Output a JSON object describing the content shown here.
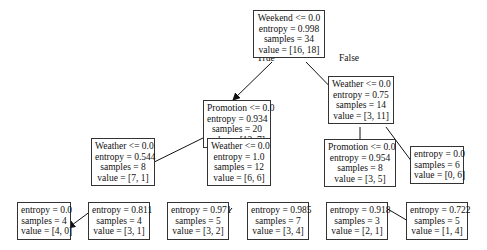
{
  "tree": {
    "nodes": [
      {
        "id": "n0",
        "lines": [
          "Weekend <= 0.0",
          "entropy = 0.998",
          "samples = 34",
          "value = [16, 18]"
        ]
      },
      {
        "id": "n1",
        "lines": [
          "Promotion <= 0.0",
          "entropy = 0.934",
          "samples = 20",
          "value = [13, 7]"
        ]
      },
      {
        "id": "n2",
        "lines": [
          "Weather <= 0.0",
          "entropy = 0.75",
          "samples = 14",
          "value = [3, 11]"
        ]
      },
      {
        "id": "n3",
        "lines": [
          "Weather <= 0.0",
          "entropy = 0.544",
          "samples = 8",
          "value = [7, 1]"
        ]
      },
      {
        "id": "n4",
        "lines": [
          "Weather <= 0.0",
          "entropy = 1.0",
          "samples = 12",
          "value = [6, 6]"
        ]
      },
      {
        "id": "n5",
        "lines": [
          "Promotion <= 0.0",
          "entropy = 0.954",
          "samples = 8",
          "value = [3, 5]"
        ]
      },
      {
        "id": "n6",
        "lines": [
          "entropy = 0.0",
          "samples = 6",
          "value = [0, 6]"
        ]
      },
      {
        "id": "n7",
        "lines": [
          "entropy = 0.0",
          "samples = 4",
          "value = [4, 0]"
        ]
      },
      {
        "id": "n8",
        "lines": [
          "entropy = 0.811",
          "samples = 4",
          "value = [3, 1]"
        ]
      },
      {
        "id": "n9",
        "lines": [
          "entropy = 0.971",
          "samples = 5",
          "value = [3, 2]"
        ]
      },
      {
        "id": "n10",
        "lines": [
          "entropy = 0.985",
          "samples = 7",
          "value = [3, 4]"
        ]
      },
      {
        "id": "n11",
        "lines": [
          "entropy = 0.918",
          "samples = 3",
          "value = [2, 1]"
        ]
      },
      {
        "id": "n12",
        "lines": [
          "entropy = 0.722",
          "samples = 5",
          "value = [1, 4]"
        ]
      }
    ],
    "edge_labels": {
      "true": "True",
      "false": "False"
    },
    "edges": [
      [
        "n0",
        "n1"
      ],
      [
        "n0",
        "n2"
      ],
      [
        "n1",
        "n3"
      ],
      [
        "n1",
        "n4"
      ],
      [
        "n2",
        "n5"
      ],
      [
        "n2",
        "n6"
      ],
      [
        "n3",
        "n7"
      ],
      [
        "n3",
        "n8"
      ],
      [
        "n4",
        "n9"
      ],
      [
        "n4",
        "n10"
      ],
      [
        "n5",
        "n11"
      ],
      [
        "n5",
        "n12"
      ]
    ]
  }
}
